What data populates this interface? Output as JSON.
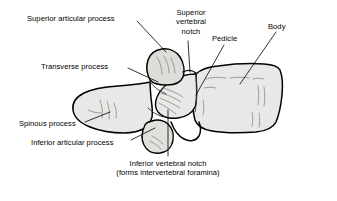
{
  "figure": {
    "background_color": "#ffffff",
    "line_color": "#000000",
    "bone_fill_color": "#e8e8e6",
    "bone_shade_color": "#c9c9c5"
  },
  "labels": {
    "superior_articular_process": "Superior articular process",
    "transverse_process": "Transverse process",
    "spinous_process": "Spinous process",
    "inferior_articular_process": "Inferior articular process",
    "superior_vertebral_notch_line1": "Superior",
    "superior_vertebral_notch_line2": "vertebral",
    "superior_vertebral_notch_line3": "notch",
    "pedicle": "Pedicle",
    "body": "Body",
    "inferior_vertebral_notch_line1": "Inferior vertebral notch",
    "inferior_vertebral_notch_line2": "(forms intervertebral foramina)"
  }
}
